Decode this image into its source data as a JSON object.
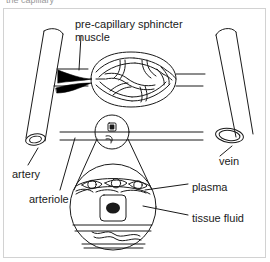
{
  "figure": {
    "clipped_header_text": "the capillary",
    "background_color": "#ffffff",
    "frame_color": "#d2d2d2",
    "ink_color": "#1a1a1a",
    "sphincter_fill": "#000000"
  },
  "labels": {
    "sphincter_line1": "pre-capillary sphincter",
    "sphincter_line2": "muscle",
    "artery": "artery",
    "arteriole": "arteriole",
    "vein": "vein",
    "plasma": "plasma",
    "tissue_fluid": "tissue fluid"
  },
  "parts": {
    "artery_vessel": "artery",
    "vein_vessel": "vein",
    "capillary_bed": "capillary-network",
    "sphincter_muscle": "pre-capillary sphincter muscle",
    "arteriole_vessel": "arteriole",
    "magnifier_small": "capillary cross-section callout",
    "magnifier_large": "magnified capillary wall detail",
    "endothelial_cells": "endothelial cells lining capillary",
    "tissue_cell": "tissue cell with nucleus"
  }
}
